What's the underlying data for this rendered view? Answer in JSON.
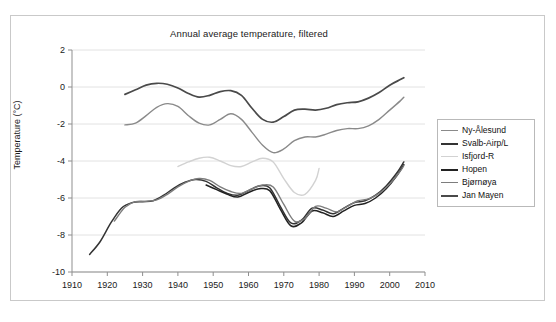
{
  "chart_data": {
    "type": "line",
    "title": "Annual average temperature, filtered",
    "xlabel": "",
    "ylabel": "Temperature (°C)",
    "xlim": [
      1910,
      2010
    ],
    "ylim": [
      -10,
      2
    ],
    "xticks": [
      1910,
      1920,
      1930,
      1940,
      1950,
      1960,
      1970,
      1980,
      1990,
      2000,
      2010
    ],
    "yticks": [
      2,
      0,
      -2,
      -4,
      -6,
      -8,
      -10
    ],
    "grid": "horizontal",
    "legend_position": "right",
    "series": [
      {
        "name": "Ny-Ålesund",
        "color": "#8a8a8a",
        "width": 1.4,
        "points": [
          [
            1925,
            -2.05
          ],
          [
            1928,
            -1.95
          ],
          [
            1931,
            -1.55
          ],
          [
            1934,
            -1.1
          ],
          [
            1937,
            -0.9
          ],
          [
            1940,
            -1.05
          ],
          [
            1943,
            -1.55
          ],
          [
            1946,
            -1.95
          ],
          [
            1949,
            -2.05
          ],
          [
            1952,
            -1.75
          ],
          [
            1955,
            -1.45
          ],
          [
            1958,
            -1.75
          ],
          [
            1961,
            -2.45
          ],
          [
            1964,
            -3.15
          ],
          [
            1967,
            -3.55
          ],
          [
            1970,
            -3.35
          ],
          [
            1973,
            -2.9
          ],
          [
            1976,
            -2.7
          ],
          [
            1979,
            -2.7
          ],
          [
            1982,
            -2.55
          ],
          [
            1985,
            -2.35
          ],
          [
            1988,
            -2.25
          ],
          [
            1991,
            -2.25
          ],
          [
            1994,
            -2.1
          ],
          [
            1997,
            -1.75
          ],
          [
            2000,
            -1.25
          ],
          [
            2003,
            -0.75
          ],
          [
            2004,
            -0.55
          ]
        ]
      },
      {
        "name": "Svalb-Airp/L",
        "color": "#333333",
        "width": 1.5,
        "points": [
          [
            1915,
            -9.05
          ],
          [
            1918,
            -8.35
          ],
          [
            1921,
            -7.35
          ],
          [
            1924,
            -6.55
          ],
          [
            1927,
            -6.25
          ],
          [
            1930,
            -6.2
          ],
          [
            1933,
            -6.15
          ],
          [
            1936,
            -5.85
          ],
          [
            1939,
            -5.45
          ],
          [
            1942,
            -5.15
          ],
          [
            1945,
            -5.0
          ],
          [
            1948,
            -5.1
          ],
          [
            1951,
            -5.45
          ],
          [
            1954,
            -5.75
          ],
          [
            1957,
            -5.85
          ],
          [
            1960,
            -5.6
          ],
          [
            1963,
            -5.35
          ],
          [
            1966,
            -5.45
          ],
          [
            1969,
            -6.45
          ],
          [
            1972,
            -7.35
          ],
          [
            1975,
            -7.2
          ],
          [
            1978,
            -6.55
          ],
          [
            1981,
            -6.65
          ],
          [
            1984,
            -6.85
          ],
          [
            1987,
            -6.55
          ],
          [
            1990,
            -6.25
          ],
          [
            1993,
            -6.15
          ],
          [
            1996,
            -5.85
          ],
          [
            1999,
            -5.35
          ],
          [
            2002,
            -4.65
          ],
          [
            2004,
            -4.05
          ]
        ]
      },
      {
        "name": "Isfjord-R",
        "color": "#d2d2d2",
        "width": 1.4,
        "points": [
          [
            1940,
            -4.3
          ],
          [
            1943,
            -4.05
          ],
          [
            1946,
            -3.85
          ],
          [
            1949,
            -3.8
          ],
          [
            1952,
            -4.0
          ],
          [
            1955,
            -4.25
          ],
          [
            1958,
            -4.3
          ],
          [
            1961,
            -4.05
          ],
          [
            1964,
            -3.85
          ],
          [
            1967,
            -4.05
          ],
          [
            1970,
            -4.95
          ],
          [
            1973,
            -5.7
          ],
          [
            1976,
            -5.8
          ],
          [
            1979,
            -5.05
          ],
          [
            1980,
            -4.4
          ]
        ]
      },
      {
        "name": "Hopen",
        "color": "#222222",
        "width": 1.5,
        "points": [
          [
            1948,
            -5.3
          ],
          [
            1951,
            -5.55
          ],
          [
            1954,
            -5.8
          ],
          [
            1957,
            -5.95
          ],
          [
            1960,
            -5.7
          ],
          [
            1963,
            -5.5
          ],
          [
            1966,
            -5.6
          ],
          [
            1969,
            -6.6
          ],
          [
            1972,
            -7.5
          ],
          [
            1975,
            -7.35
          ],
          [
            1978,
            -6.7
          ],
          [
            1981,
            -6.8
          ],
          [
            1984,
            -7.0
          ],
          [
            1987,
            -6.7
          ],
          [
            1990,
            -6.4
          ],
          [
            1993,
            -6.3
          ],
          [
            1996,
            -6.0
          ],
          [
            1999,
            -5.5
          ],
          [
            2002,
            -4.8
          ],
          [
            2004,
            -4.2
          ]
        ]
      },
      {
        "name": "Bjørnøya",
        "color": "#7d7d7d",
        "width": 1.4,
        "points": [
          [
            1922,
            -7.25
          ],
          [
            1925,
            -6.5
          ],
          [
            1928,
            -6.2
          ],
          [
            1931,
            -6.18
          ],
          [
            1934,
            -6.1
          ],
          [
            1937,
            -5.8
          ],
          [
            1940,
            -5.4
          ],
          [
            1943,
            -5.1
          ],
          [
            1946,
            -4.95
          ],
          [
            1949,
            -5.05
          ],
          [
            1952,
            -5.4
          ],
          [
            1955,
            -5.65
          ],
          [
            1958,
            -5.75
          ],
          [
            1961,
            -5.5
          ],
          [
            1964,
            -5.3
          ],
          [
            1967,
            -5.4
          ],
          [
            1970,
            -6.35
          ],
          [
            1973,
            -7.25
          ],
          [
            1976,
            -7.1
          ],
          [
            1979,
            -6.45
          ],
          [
            1982,
            -6.55
          ],
          [
            1985,
            -6.75
          ],
          [
            1988,
            -6.45
          ],
          [
            1991,
            -6.15
          ],
          [
            1994,
            -6.05
          ],
          [
            1997,
            -5.75
          ],
          [
            2000,
            -5.25
          ],
          [
            2003,
            -4.55
          ],
          [
            2004,
            -4.25
          ]
        ]
      },
      {
        "name": "Jan Mayen",
        "color": "#4a4a4a",
        "width": 1.7,
        "points": [
          [
            1925,
            -0.4
          ],
          [
            1928,
            -0.15
          ],
          [
            1931,
            0.1
          ],
          [
            1934,
            0.2
          ],
          [
            1937,
            0.15
          ],
          [
            1940,
            -0.05
          ],
          [
            1943,
            -0.35
          ],
          [
            1946,
            -0.55
          ],
          [
            1949,
            -0.45
          ],
          [
            1952,
            -0.25
          ],
          [
            1955,
            -0.2
          ],
          [
            1958,
            -0.45
          ],
          [
            1961,
            -1.15
          ],
          [
            1964,
            -1.75
          ],
          [
            1967,
            -1.9
          ],
          [
            1970,
            -1.6
          ],
          [
            1973,
            -1.25
          ],
          [
            1976,
            -1.2
          ],
          [
            1979,
            -1.25
          ],
          [
            1982,
            -1.15
          ],
          [
            1985,
            -0.95
          ],
          [
            1988,
            -0.85
          ],
          [
            1991,
            -0.8
          ],
          [
            1994,
            -0.6
          ],
          [
            1997,
            -0.3
          ],
          [
            2000,
            0.1
          ],
          [
            2003,
            0.4
          ],
          [
            2004,
            0.5
          ]
        ]
      }
    ]
  },
  "legend": {
    "items": [
      {
        "label": "Ny-Ålesund"
      },
      {
        "label": "Svalb-Airp/L"
      },
      {
        "label": "Isfjord-R"
      },
      {
        "label": "Hopen"
      },
      {
        "label": "Bjørnøya"
      },
      {
        "label": "Jan Mayen"
      }
    ]
  }
}
